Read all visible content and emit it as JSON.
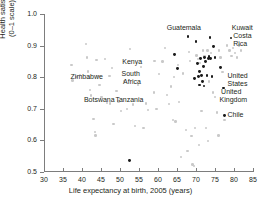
{
  "figure": {
    "background": "#ffffff",
    "point_color_light": "#c9c9c9",
    "point_color_dark": "#1a1a1a",
    "axis_color": "#7d7d7d",
    "top_fragment": "clipped text"
  },
  "chart_data": {
    "type": "scatter",
    "title": "",
    "xlabel": "Life expectancy at birth, 2005 (years)",
    "ylabel_line1": "Health satisfaction",
    "ylabel_line2": "(0–1 scale), 2006",
    "xlim": [
      30,
      85
    ],
    "ylim": [
      0.5,
      1.0
    ],
    "xticks": [
      30,
      35,
      40,
      45,
      50,
      55,
      60,
      65,
      70,
      75,
      80,
      85
    ],
    "xtick_labels": [
      "30",
      "35",
      "40",
      "45",
      "50",
      "55",
      "60",
      "65",
      "70",
      "75",
      "80",
      "85"
    ],
    "yticks": [
      0.5,
      0.6,
      0.7,
      0.8,
      0.9,
      1.0
    ],
    "ytick_labels": [
      "0.5",
      "0.6",
      "0.7",
      "0.8",
      "0.9",
      "1.0"
    ],
    "grid": false,
    "legend": false,
    "series": [
      {
        "name": "Other countries",
        "marker": "circle",
        "color": "#c9c9c9",
        "points": [
          [
            37.2,
            0.838
          ],
          [
            37.5,
            0.79
          ],
          [
            38.6,
            0.801
          ],
          [
            39.4,
            0.806
          ],
          [
            41.0,
            0.905
          ],
          [
            41.3,
            0.862
          ],
          [
            41.6,
            0.818
          ],
          [
            41.9,
            0.797
          ],
          [
            42.1,
            0.76
          ],
          [
            42.4,
            0.742
          ],
          [
            43.0,
            0.667
          ],
          [
            43.4,
            0.627
          ],
          [
            43.6,
            0.615
          ],
          [
            44.2,
            0.803
          ],
          [
            44.6,
            0.776
          ],
          [
            45.1,
            0.738
          ],
          [
            46.0,
            0.857
          ],
          [
            46.6,
            0.718
          ],
          [
            47.2,
            0.803
          ],
          [
            47.9,
            0.829
          ],
          [
            48.3,
            0.651
          ],
          [
            49.1,
            0.757
          ],
          [
            49.6,
            0.723
          ],
          [
            50.3,
            0.693
          ],
          [
            51.0,
            0.788
          ],
          [
            51.8,
            0.7
          ],
          [
            52.6,
            0.889
          ],
          [
            53.4,
            0.713
          ],
          [
            53.9,
            0.645
          ],
          [
            54.7,
            0.776
          ],
          [
            55.6,
            0.832
          ],
          [
            56.8,
            0.717
          ],
          [
            57.3,
            0.697
          ],
          [
            58.9,
            0.752
          ],
          [
            59.6,
            0.7
          ],
          [
            60.2,
            0.81
          ],
          [
            61.2,
            0.85
          ],
          [
            61.8,
            0.893
          ],
          [
            62.3,
            0.744
          ],
          [
            62.9,
            0.716
          ],
          [
            63.4,
            0.77
          ],
          [
            63.9,
            0.664
          ],
          [
            64.6,
            0.66
          ],
          [
            65.2,
            0.838
          ],
          [
            65.6,
            0.721
          ],
          [
            66.1,
            0.548
          ],
          [
            66.6,
            0.812
          ],
          [
            67.3,
            0.633
          ],
          [
            67.8,
            0.566
          ],
          [
            68.1,
            0.879
          ],
          [
            68.5,
            0.852
          ],
          [
            68.8,
            0.613
          ],
          [
            69.1,
            0.524
          ],
          [
            69.4,
            0.519
          ],
          [
            69.7,
            0.64
          ],
          [
            70.1,
            0.869
          ],
          [
            70.6,
            0.857
          ],
          [
            71.0,
            0.845
          ],
          [
            71.4,
            0.693
          ],
          [
            71.8,
            0.884
          ],
          [
            72.2,
            0.868
          ],
          [
            72.6,
            0.64
          ],
          [
            73.0,
            0.884
          ],
          [
            73.5,
            0.786
          ],
          [
            74.0,
            0.877
          ],
          [
            74.5,
            0.752
          ],
          [
            75.0,
            0.737
          ],
          [
            75.5,
            0.688
          ],
          [
            76.0,
            0.884
          ],
          [
            76.4,
            0.862
          ],
          [
            77.0,
            0.816
          ],
          [
            77.5,
            0.664
          ],
          [
            78.2,
            0.9
          ],
          [
            78.8,
            0.884
          ],
          [
            79.3,
            0.868
          ],
          [
            79.8,
            0.893
          ],
          [
            80.2,
            0.877
          ],
          [
            80.8,
            0.862
          ],
          [
            81.3,
            0.9
          ],
          [
            81.8,
            0.884
          ],
          [
            59.1,
            0.852
          ],
          [
            64.2,
            0.8
          ],
          [
            56.2,
            0.639
          ],
          [
            47.4,
            0.717
          ],
          [
            43.8,
            0.855
          ],
          [
            75.9,
            0.615
          ],
          [
            73.2,
            0.598
          ],
          [
            70.8,
            0.585
          ]
        ]
      },
      {
        "name": "Highlighted countries",
        "marker": "circle",
        "color": "#1a1a1a",
        "points": [
          [
            52.4,
            0.536
          ],
          [
            64.3,
            0.873
          ],
          [
            65.1,
            0.827
          ],
          [
            67.9,
            0.93
          ],
          [
            70.0,
            0.912
          ],
          [
            70.4,
            0.843
          ],
          [
            70.7,
            0.801
          ],
          [
            70.9,
            0.817
          ],
          [
            71.2,
            0.86
          ],
          [
            71.5,
            0.805
          ],
          [
            71.7,
            0.786
          ],
          [
            72.0,
            0.833
          ],
          [
            72.3,
            0.862
          ],
          [
            72.6,
            0.849
          ],
          [
            72.9,
            0.806
          ],
          [
            73.2,
            0.86
          ],
          [
            73.4,
            0.866
          ],
          [
            73.7,
            0.925
          ],
          [
            73.9,
            0.86
          ],
          [
            74.2,
            0.801
          ],
          [
            74.6,
            0.897
          ],
          [
            75.0,
            0.862
          ],
          [
            76.4,
            0.831
          ],
          [
            77.2,
            0.766
          ],
          [
            77.6,
            0.679
          ],
          [
            79.2,
            0.924
          ],
          [
            71.0,
            0.775
          ],
          [
            72.1,
            0.772
          ],
          [
            69.6,
            0.795
          ]
        ]
      }
    ],
    "annotations": [
      {
        "text": "Zimbabwe",
        "x": 37.0,
        "y": 0.8,
        "align": "left"
      },
      {
        "text": "Botswana",
        "x": 40.5,
        "y": 0.728,
        "align": "left"
      },
      {
        "text": "Kenya",
        "x": 50.6,
        "y": 0.849,
        "align": "left"
      },
      {
        "text": "South",
        "x": 50.4,
        "y": 0.81,
        "align": "left"
      },
      {
        "text": "Africa",
        "x": 50.8,
        "y": 0.784,
        "align": "left"
      },
      {
        "text": "Tanzania",
        "x": 48.8,
        "y": 0.728,
        "align": "left"
      },
      {
        "text": "Guatemala",
        "x": 66.8,
        "y": 0.955,
        "align": "center"
      },
      {
        "text": "Kuwait",
        "x": 79.4,
        "y": 0.957,
        "align": "left"
      },
      {
        "text": "Costa",
        "x": 79.8,
        "y": 0.93,
        "align": "left"
      },
      {
        "text": "Rica",
        "x": 79.8,
        "y": 0.905,
        "align": "left"
      },
      {
        "text": "United",
        "x": 78.3,
        "y": 0.805,
        "align": "left"
      },
      {
        "text": "States",
        "x": 78.3,
        "y": 0.78,
        "align": "left"
      },
      {
        "text": "United",
        "x": 76.6,
        "y": 0.752,
        "align": "left"
      },
      {
        "text": "Kingdom",
        "x": 76.2,
        "y": 0.727,
        "align": "left"
      },
      {
        "text": "Chile",
        "x": 78.3,
        "y": 0.681,
        "align": "left"
      }
    ]
  }
}
